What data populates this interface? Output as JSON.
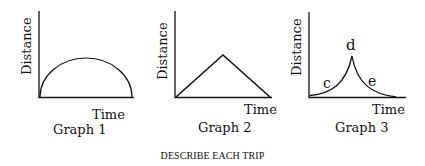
{
  "graphs": [
    {
      "title": "Graph 1",
      "ylabel": "Distance",
      "xlabel": "Time",
      "shape": "semicircle",
      "points_labels": []
    },
    {
      "title": "Graph 2",
      "ylabel": "Distance",
      "xlabel": "Time",
      "shape": "triangle",
      "points_labels": []
    },
    {
      "title": "Graph 3",
      "ylabel": "Distance",
      "xlabel": "Time",
      "shape": "cusp",
      "points_labels": [
        "c",
        "d",
        "e"
      ]
    }
  ],
  "caption": "DESCRIBE EACH TRIP"
}
